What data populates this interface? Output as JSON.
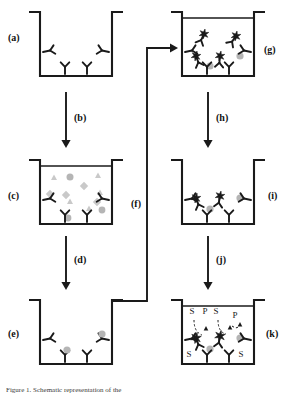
{
  "figure": {
    "type": "sandwich-elisa-schematic",
    "caption": "Figure 1. Schematic representation of the",
    "background_color": "#ffffff",
    "line_color": "#1a1a1a",
    "shape_fill_gray": "#b5b5b5",
    "shape_fill_lightgray": "#c9c9c9",
    "star_color": "#1a1a1a"
  },
  "panels": [
    {
      "id": "a",
      "label": "(a)",
      "label_x": 8,
      "label_y": 38,
      "well_x": 40,
      "well_y": 12,
      "well_w": 72,
      "well_h": 64,
      "description": "Empty well coated with capture antibodies",
      "contents": {
        "capture_antibodies": 4,
        "antigens": 0,
        "detection_conjugates": 0,
        "free_shapes": 0
      }
    },
    {
      "id": "c",
      "label": "(c)",
      "label_x": 8,
      "label_y": 196,
      "well_x": 40,
      "well_y": 160,
      "well_w": 72,
      "well_h": 64,
      "description": "Sample added: mixture of analyte and interfering molecules",
      "contents": {
        "capture_antibodies": 4,
        "antigens": 2,
        "detection_conjugates": 0,
        "free_shapes": 13
      }
    },
    {
      "id": "e",
      "label": "(e)",
      "label_x": 8,
      "label_y": 334,
      "well_x": 40,
      "well_y": 300,
      "well_w": 72,
      "well_h": 64,
      "description": "After washing: only specific antigen remains bound",
      "contents": {
        "capture_antibodies": 4,
        "antigens": 2,
        "detection_conjugates": 0,
        "free_shapes": 0
      }
    },
    {
      "id": "g",
      "label": "(g)",
      "label_x": 262,
      "label_y": 50,
      "well_x": 182,
      "well_y": 12,
      "well_w": 72,
      "well_h": 64,
      "description": "Enzyme-labelled detection antibody added in excess",
      "contents": {
        "capture_antibodies": 4,
        "antigens": 2,
        "detection_conjugates": 4,
        "free_conjugates": 2
      }
    },
    {
      "id": "i",
      "label": "(i)",
      "label_x": 266,
      "label_y": 196,
      "well_x": 182,
      "well_y": 160,
      "well_w": 72,
      "well_h": 64,
      "description": "After washing: only bound enzyme conjugates remain",
      "contents": {
        "capture_antibodies": 4,
        "antigens": 2,
        "detection_conjugates": 2,
        "free_conjugates": 0
      }
    },
    {
      "id": "k",
      "label": "(k)",
      "label_x": 264,
      "label_y": 334,
      "well_x": 182,
      "well_y": 300,
      "well_w": 72,
      "well_h": 64,
      "description": "Substrate added and converted to coloured product by enzyme",
      "contents": {
        "capture_antibodies": 4,
        "antigens": 2,
        "detection_conjugates": 2,
        "substrate_labels": 4,
        "product_labels": 2
      },
      "reaction_labels": {
        "substrate": "S",
        "product": "P",
        "substrate_positions": [
          {
            "x": 192,
            "y": 314
          },
          {
            "x": 216,
            "y": 314
          },
          {
            "x": 189,
            "y": 357
          },
          {
            "x": 241,
            "y": 357
          }
        ],
        "product_positions": [
          {
            "x": 205,
            "y": 314
          },
          {
            "x": 235,
            "y": 318
          }
        ]
      }
    }
  ],
  "arrows": [
    {
      "id": "b",
      "label": "(b)",
      "label_x": 80,
      "label_y": 120,
      "from_panel": "a",
      "to_panel": "c",
      "orientation": "down",
      "x": 66,
      "y1": 92,
      "y2": 148
    },
    {
      "id": "d",
      "label": "(d)",
      "label_x": 80,
      "label_y": 262,
      "from_panel": "c",
      "to_panel": "e",
      "orientation": "down",
      "x": 66,
      "y1": 236,
      "y2": 290
    },
    {
      "id": "f",
      "label": "(f)",
      "label_x": 137,
      "label_y": 205,
      "from_panel": "e",
      "to_panel": "g",
      "orientation": "elbow-up-right",
      "path": "M 112 301 L 147 301 L 147 48 L 176 48"
    },
    {
      "id": "h",
      "label": "(h)",
      "label_x": 222,
      "label_y": 120,
      "from_panel": "g",
      "to_panel": "i",
      "orientation": "down",
      "x": 208,
      "y1": 92,
      "y2": 148
    },
    {
      "id": "j",
      "label": "(j)",
      "label_x": 222,
      "label_y": 262,
      "from_panel": "i",
      "to_panel": "k",
      "orientation": "down",
      "x": 208,
      "y1": 236,
      "y2": 290
    }
  ],
  "legend_semantics": {
    "y_shape": "antibody",
    "gray_circle": "target antigen",
    "gray_triangle": "interfering molecule",
    "gray_diamond": "interfering molecule",
    "star": "enzyme label",
    "S": "substrate",
    "P": "product"
  }
}
